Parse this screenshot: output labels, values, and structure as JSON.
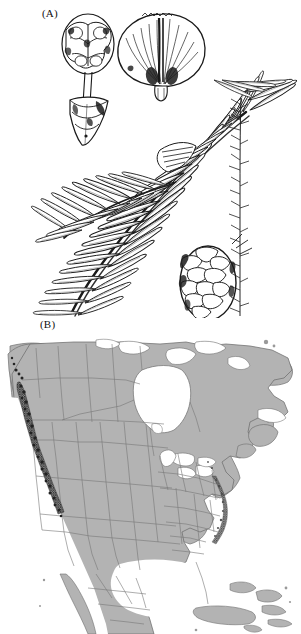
{
  "figure": {
    "type": "scientific-figure-two-panel",
    "background_color": "#ffffff"
  },
  "panel_a": {
    "label": "(A)",
    "caption": "",
    "kind": "botanical-line-illustration",
    "subject": "conifer branch with needles, cone scales and seed cone",
    "ink_color": "#1a1a1a",
    "elements": [
      {
        "name": "seed-scale-with-stalk",
        "description": "ovate seed scale on long stalk with bract at base",
        "x": 88,
        "y": 60
      },
      {
        "name": "fan-shaped-cone-scale",
        "description": "broad fan-shaped cone scale with radiating striations and two seed wings",
        "x": 155,
        "y": 55
      },
      {
        "name": "foliage-branch",
        "description": "branch bearing flat linear needles in two ranks",
        "x": 150,
        "y": 200
      },
      {
        "name": "seed-cone",
        "description": "ovoid seed cone with overlapping imbricate scales",
        "x": 208,
        "y": 282
      },
      {
        "name": "twig-fragment",
        "description": "vertical needle-bearing twig at right margin",
        "x": 240,
        "y": 200
      }
    ]
  },
  "panel_b": {
    "label": "(B)",
    "caption": "",
    "kind": "distribution-range-map",
    "region": "North America",
    "colors": {
      "land": "#b0b0b0",
      "land_outline": "#6e6e6e",
      "water": "#ffffff",
      "state_border": "#7a7a7a",
      "range_shading": "#2e2e2e",
      "range_shading_secondary": "#5a5a5a"
    },
    "features": [
      {
        "name": "landmass-north-america",
        "fill": "#b0b0b0"
      },
      {
        "name": "hudson-bay",
        "fill": "#ffffff"
      },
      {
        "name": "great-lakes",
        "fill": "#ffffff"
      },
      {
        "name": "gulf-of-mexico",
        "fill": "#ffffff"
      },
      {
        "name": "caribbean-islands",
        "fill": "#b0b0b0"
      },
      {
        "name": "state-province-borders",
        "stroke": "#7a7a7a"
      }
    ],
    "range": {
      "primary_band": "Pacific Northwest coastal strip from southeast Alaska and British Columbia south through Washington and Oregon into northern California",
      "secondary_band": "Appalachian highlands of eastern North America",
      "style": "dark stippled shading"
    }
  }
}
